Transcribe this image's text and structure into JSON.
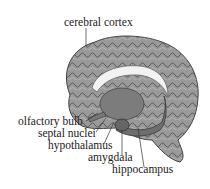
{
  "diagram": {
    "labels": {
      "cortex": "cerebral cortex",
      "olfactory": "olfactory bulb",
      "septal": "septal nuclei",
      "hypothalamus": "hypothalamus",
      "amygdala": "amygdala",
      "hippocampus": "hippocampus"
    },
    "colors": {
      "cortex": "#8a8a8a",
      "corpus_callosum": "#f2f2f2",
      "limbic": "#6e6e6e",
      "text": "#222222"
    }
  }
}
